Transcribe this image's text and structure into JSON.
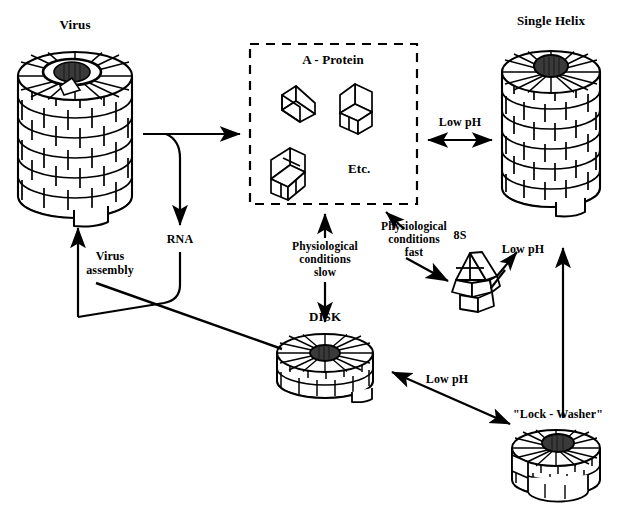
{
  "diagram": {
    "title_semantic": "tmv-assembly-pathway",
    "ink_color": "#000000",
    "background_color": "#ffffff",
    "rna_core_color": "#3a3a3a"
  },
  "nodes": {
    "virus": {
      "label": "Virus"
    },
    "a_protein": {
      "label": "A - Protein",
      "etc_label": "Etc."
    },
    "single_helix": {
      "label": "Single Helix"
    },
    "eight_s": {
      "label": "8S"
    },
    "disk": {
      "label": "DISK"
    },
    "lock_washer": {
      "label": "\"Lock - Washer\""
    },
    "rna": {
      "label": "RNA"
    }
  },
  "edges": {
    "virus_to_aprotein": {
      "label": ""
    },
    "virus_to_rna": {
      "label": "RNA"
    },
    "virus_assembly": {
      "label": "Virus\nassembly",
      "line1": "Virus",
      "line2": "assembly"
    },
    "aprotein_to_helix": {
      "label": "Low pH"
    },
    "aprotein_to_disk": {
      "line1": "Physiological",
      "line2": "conditions",
      "line3": "slow"
    },
    "aprotein_to_8s": {
      "line1": "Physiological",
      "line2": "conditions",
      "line3": "fast"
    },
    "eights_to_helix": {
      "label": "Low pH"
    },
    "disk_to_lockwasher": {
      "label": "Low pH"
    },
    "lockwasher_to_helix": {
      "label": ""
    }
  }
}
